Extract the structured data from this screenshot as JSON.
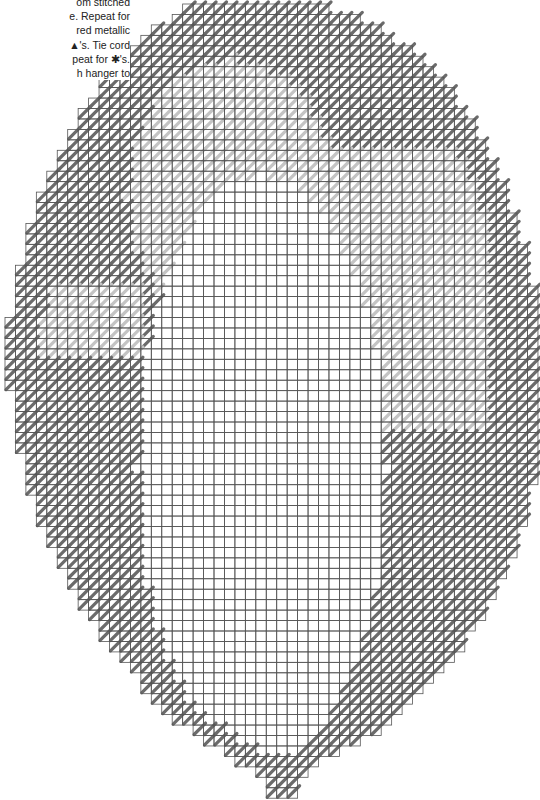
{
  "instructions": {
    "lines": [
      "om stitched",
      "e. Repeat for",
      "red metallic",
      "▲'s. Tie cord",
      "peat for ✱'s.",
      "h hanger to"
    ]
  },
  "chart": {
    "cell_px": 10.45,
    "origin": [
      5,
      4
    ],
    "cols": 51,
    "rows": 76,
    "colors": {
      "grid": "#555555",
      "dark_stitch": "#6b6b6b",
      "light_stitch": "#c4c4c4",
      "background": "#ffffff"
    },
    "row_extents": [
      [
        17,
        30
      ],
      [
        16,
        33
      ],
      [
        14,
        35
      ],
      [
        13,
        36
      ],
      [
        12,
        38
      ],
      [
        11,
        39
      ],
      [
        10,
        40
      ],
      [
        9,
        41
      ],
      [
        9,
        42
      ],
      [
        8,
        42
      ],
      [
        7,
        43
      ],
      [
        7,
        44
      ],
      [
        6,
        44
      ],
      [
        6,
        45
      ],
      [
        5,
        45
      ],
      [
        5,
        46
      ],
      [
        4,
        46
      ],
      [
        4,
        47
      ],
      [
        3,
        47
      ],
      [
        3,
        47
      ],
      [
        3,
        48
      ],
      [
        2,
        48
      ],
      [
        2,
        48
      ],
      [
        2,
        49
      ],
      [
        2,
        49
      ],
      [
        1,
        49
      ],
      [
        1,
        49
      ],
      [
        1,
        50
      ],
      [
        1,
        50
      ],
      [
        1,
        50
      ],
      [
        0,
        50
      ],
      [
        0,
        50
      ],
      [
        0,
        50
      ],
      [
        0,
        50
      ],
      [
        0,
        50
      ],
      [
        0,
        50
      ],
      [
        0,
        50
      ],
      [
        1,
        50
      ],
      [
        1,
        50
      ],
      [
        1,
        50
      ],
      [
        1,
        50
      ],
      [
        1,
        50
      ],
      [
        1,
        50
      ],
      [
        2,
        50
      ],
      [
        2,
        50
      ],
      [
        2,
        50
      ],
      [
        2,
        49
      ],
      [
        3,
        49
      ],
      [
        3,
        49
      ],
      [
        3,
        49
      ],
      [
        4,
        48
      ],
      [
        4,
        48
      ],
      [
        5,
        48
      ],
      [
        5,
        47
      ],
      [
        6,
        47
      ],
      [
        6,
        46
      ],
      [
        7,
        46
      ],
      [
        7,
        45
      ],
      [
        8,
        45
      ],
      [
        9,
        44
      ],
      [
        9,
        43
      ],
      [
        10,
        43
      ],
      [
        11,
        42
      ],
      [
        12,
        41
      ],
      [
        13,
        40
      ],
      [
        13,
        39
      ],
      [
        14,
        38
      ],
      [
        15,
        37
      ],
      [
        16,
        36
      ],
      [
        18,
        35
      ],
      [
        19,
        33
      ],
      [
        21,
        31
      ],
      [
        22,
        29
      ],
      [
        24,
        28
      ],
      [
        25,
        27
      ],
      [
        25,
        27
      ]
    ],
    "border_width": 3,
    "center_white": {
      "cx": 24,
      "cy": 44,
      "rx": 12,
      "ry": 28
    },
    "arch_light": {
      "cx": 21,
      "cy": 18,
      "rx": 10,
      "ry": 13
    },
    "right_block_light": {
      "x0": 29,
      "x1": 45,
      "y0": 14,
      "y1": 40
    },
    "left_band_light": {
      "x0": 2,
      "x1": 12,
      "y0": 27,
      "y1": 33
    }
  }
}
